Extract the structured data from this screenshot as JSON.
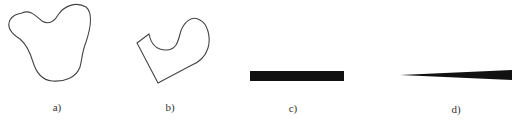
{
  "figure": {
    "panels": [
      {
        "id": "a",
        "label": "a)",
        "shape": "closed-curved-blob-outline",
        "stroke": "#444444"
      },
      {
        "id": "b",
        "label": "b)",
        "shape": "straight-edged-and-curved-closed-outline",
        "stroke": "#444444"
      },
      {
        "id": "c",
        "label": "c)",
        "shape": "filled-thin-rectangle",
        "fill": "#111111"
      },
      {
        "id": "d",
        "label": "d)",
        "shape": "filled-tapered-wedge",
        "fill": "#111111"
      }
    ]
  }
}
